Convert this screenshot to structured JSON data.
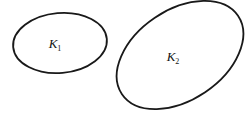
{
  "figure": {
    "canvas": {
      "width": 251,
      "height": 115,
      "background_color": "#ffffff"
    },
    "style": {
      "stroke_color": "#191919",
      "stroke_width": 1.8,
      "label_color": "#141414"
    },
    "regions": [
      {
        "id": "region-k1",
        "label_base": "K",
        "label_subscript": "1",
        "label_full": "K1",
        "shape": "ellipse",
        "center_x": 60,
        "center_y": 43,
        "radius_x": 47,
        "radius_y": 30,
        "rotation_deg": -5,
        "label_x": 55,
        "label_y": 48
      },
      {
        "id": "region-k2",
        "label_base": "K",
        "label_subscript": "2",
        "label_full": "K2",
        "shape": "ellipse",
        "center_x": 180,
        "center_y": 55,
        "radius_x": 70,
        "radius_y": 45,
        "rotation_deg": -34,
        "label_x": 173,
        "label_y": 61
      }
    ]
  }
}
